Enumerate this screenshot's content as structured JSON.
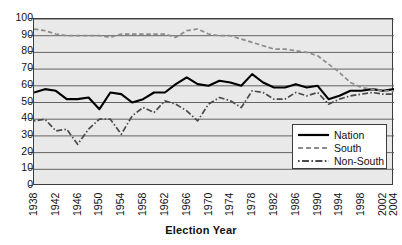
{
  "chart_data": {
    "type": "line",
    "title": "",
    "xlabel": "Election Year",
    "ylabel": "",
    "ylim": [
      0,
      100
    ],
    "xlim": [
      1938,
      2004
    ],
    "grid": true,
    "legend_position": "inside-bottom-right",
    "y_ticks": [
      0,
      10,
      20,
      30,
      40,
      50,
      60,
      70,
      80,
      90,
      100
    ],
    "x_tick_labels": [
      "1938",
      "1942",
      "1946",
      "1950",
      "1954",
      "1958",
      "1962",
      "1966",
      "1970",
      "1974",
      "1978",
      "1982",
      "1986",
      "1990",
      "1994",
      "1998",
      "2002",
      "2004"
    ],
    "x": [
      1938,
      1940,
      1942,
      1944,
      1946,
      1948,
      1950,
      1952,
      1954,
      1956,
      1958,
      1960,
      1962,
      1964,
      1966,
      1968,
      1970,
      1972,
      1974,
      1976,
      1978,
      1980,
      1982,
      1984,
      1986,
      1988,
      1990,
      1992,
      1994,
      1996,
      1998,
      2000,
      2002,
      2004
    ],
    "series": [
      {
        "name": "Nation",
        "style": "solid",
        "color": "#000000",
        "values": [
          56,
          58,
          57,
          52,
          52,
          53,
          46,
          56,
          55,
          50,
          52,
          56,
          56,
          61,
          65,
          61,
          60,
          63,
          62,
          60,
          67,
          62,
          59,
          59,
          61,
          59,
          60,
          52,
          54,
          57,
          57,
          58,
          57,
          58
        ]
      },
      {
        "name": "South",
        "style": "dashed",
        "color": "#8c8c8c",
        "values": [
          94,
          93,
          91,
          90,
          90,
          90,
          90,
          89,
          91,
          91,
          91,
          91,
          91,
          89,
          93,
          94,
          91,
          90,
          90,
          88,
          86,
          84,
          82,
          82,
          81,
          80,
          78,
          73,
          68,
          62,
          59,
          58,
          57,
          57
        ]
      },
      {
        "name": "Non-South",
        "style": "dashdot",
        "color": "#4a4a4a",
        "values": [
          39,
          40,
          33,
          34,
          25,
          34,
          40,
          40,
          31,
          42,
          47,
          44,
          51,
          49,
          45,
          39,
          49,
          53,
          51,
          47,
          57,
          56,
          52,
          52,
          56,
          54,
          56,
          49,
          52,
          54,
          55,
          56,
          55,
          55
        ]
      }
    ]
  },
  "legend": {
    "items": [
      {
        "label": "Nation",
        "style": "solid"
      },
      {
        "label": "South",
        "style": "dashed"
      },
      {
        "label": "Non-South",
        "style": "dashdot"
      }
    ]
  },
  "axis_title": {
    "x": "Election Year"
  },
  "colors": {
    "plot_background": "#e9e9e9",
    "axis": "#3c3c3c",
    "gridline": "#555555",
    "nation": "#000000",
    "south": "#8c8c8c",
    "non_south": "#4a4a4a"
  }
}
